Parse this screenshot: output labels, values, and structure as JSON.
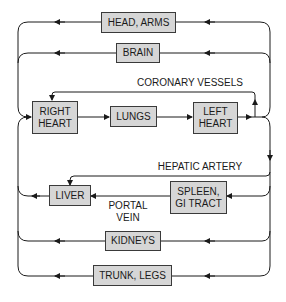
{
  "diagram": {
    "title": "",
    "type": "circulation-flow",
    "colors": {
      "box_fill": "#d6d6d6",
      "box_border": "#3a3a3a",
      "line": "#1a1a1a"
    },
    "nodes": {
      "head_arms": "HEAD, ARMS",
      "brain": "BRAIN",
      "right_heart": "RIGHT\nHEART",
      "lungs": "LUNGS",
      "left_heart": "LEFT\nHEART",
      "liver": "LIVER",
      "spleen_gi": "SPLEEN,\nGI TRACT",
      "kidneys": "KIDNEYS",
      "trunk_legs": "TRUNK, LEGS"
    },
    "labels": {
      "coronary": "CORONARY VESSELS",
      "hepatic": "HEPATIC ARTERY",
      "portal": "PORTAL\nVEIN"
    },
    "edges": [
      {
        "from": "RIGHT HEART",
        "to": "LUNGS"
      },
      {
        "from": "LUNGS",
        "to": "LEFT HEART"
      },
      {
        "from": "LEFT HEART",
        "to": "HEAD, ARMS"
      },
      {
        "from": "LEFT HEART",
        "to": "BRAIN"
      },
      {
        "from": "LEFT HEART",
        "to": "RIGHT HEART",
        "via": "CORONARY VESSELS"
      },
      {
        "from": "LEFT HEART",
        "to": "LIVER",
        "via": "HEPATIC ARTERY"
      },
      {
        "from": "LEFT HEART",
        "to": "SPLEEN, GI TRACT"
      },
      {
        "from": "SPLEEN, GI TRACT",
        "to": "LIVER",
        "via": "PORTAL VEIN"
      },
      {
        "from": "LEFT HEART",
        "to": "KIDNEYS"
      },
      {
        "from": "LEFT HEART",
        "to": "TRUNK, LEGS"
      },
      {
        "from": "HEAD, ARMS",
        "to": "RIGHT HEART"
      },
      {
        "from": "BRAIN",
        "to": "RIGHT HEART"
      },
      {
        "from": "LIVER",
        "to": "RIGHT HEART"
      },
      {
        "from": "KIDNEYS",
        "to": "RIGHT HEART"
      },
      {
        "from": "TRUNK, LEGS",
        "to": "RIGHT HEART"
      }
    ]
  }
}
